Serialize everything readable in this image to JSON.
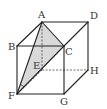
{
  "diagram": {
    "type": "cube-geometry",
    "vertices": {
      "A": {
        "x": 42,
        "y": 22,
        "label": "A"
      },
      "D": {
        "x": 88,
        "y": 22,
        "label": "D"
      },
      "B": {
        "x": 17,
        "y": 46,
        "label": "B"
      },
      "C": {
        "x": 64,
        "y": 46,
        "label": "C"
      },
      "E": {
        "x": 42,
        "y": 70,
        "label": "E"
      },
      "H": {
        "x": 88,
        "y": 70,
        "label": "H"
      },
      "F": {
        "x": 17,
        "y": 94,
        "label": "F"
      },
      "G": {
        "x": 64,
        "y": 94,
        "label": "G"
      }
    },
    "solid_edges": [
      "AB",
      "AD",
      "BC",
      "CD",
      "BF",
      "CG",
      "DH",
      "FG",
      "GH",
      "AC",
      "AF",
      "CF"
    ],
    "hidden_edges": [
      "AE",
      "EF",
      "EH"
    ],
    "shaded_face": "ACF",
    "angle_marker_at": "F",
    "colors": {
      "edge": "#222222",
      "hidden_edge": "#444444",
      "shade": "#d9d9d9",
      "label": "#333333"
    }
  }
}
